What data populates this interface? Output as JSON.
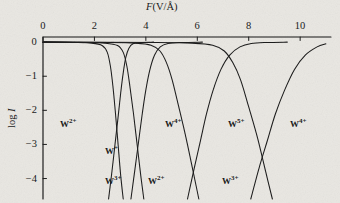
{
  "figure": {
    "background_color": "#e9e7e2",
    "ink_color": "#1a1a1a",
    "bleedthrough_text": "sample of the overlying page text showing through the thin paper of this scanned book figure and it continues for several lines across the block of justified body copy beneath the reproduced graph of field evaporation charge state distributions measured for tungsten emitter tips under varying applied electric field strength conditions",
    "axis_title": "F(V/Å)",
    "axis_title_italic_part": "F",
    "ylabel": "log I",
    "ylabel_italic_part": "I"
  },
  "chart_data": {
    "type": "line",
    "title": "",
    "xlabel": "F(V/Å)",
    "ylabel": "log I",
    "xlim": [
      0,
      11.2
    ],
    "ylim": [
      -4.6,
      0.15
    ],
    "xticks": [
      0,
      2,
      4,
      6,
      8,
      10
    ],
    "xtick_labels": [
      "0",
      "2",
      "4",
      "6",
      "8",
      "10"
    ],
    "yticks": [
      0,
      -1,
      -2,
      -3,
      -4
    ],
    "ytick_labels": [
      "0",
      "−1",
      "−2",
      "−3",
      "−4"
    ],
    "grid": false,
    "legend": "none",
    "axis_position": {
      "x_axis": "top",
      "y_axis": "left"
    },
    "series": [
      {
        "name": "W2+ rising branch",
        "label": "W2+",
        "points": [
          [
            0.0,
            0.0
          ],
          [
            1.2,
            -0.01
          ],
          [
            1.9,
            -0.03
          ],
          [
            2.3,
            -0.1
          ],
          [
            2.5,
            -0.3
          ],
          [
            2.62,
            -0.7
          ],
          [
            2.72,
            -1.3
          ],
          [
            2.82,
            -2.1
          ],
          [
            2.92,
            -3.0
          ],
          [
            3.02,
            -3.9
          ],
          [
            3.12,
            -4.6
          ]
        ]
      },
      {
        "name": "W1+ falling branch",
        "label": "W+",
        "points": [
          [
            2.55,
            -4.6
          ],
          [
            2.68,
            -3.8
          ],
          [
            2.8,
            -3.0
          ],
          [
            2.92,
            -2.2
          ],
          [
            3.02,
            -1.5
          ],
          [
            3.12,
            -0.9
          ],
          [
            3.22,
            -0.45
          ],
          [
            3.34,
            -0.18
          ],
          [
            3.5,
            -0.05
          ],
          [
            3.8,
            -0.01
          ],
          [
            4.3,
            0.0
          ]
        ]
      },
      {
        "name": "W3+ rising branch",
        "label": "W3+",
        "points": [
          [
            0.0,
            0.0
          ],
          [
            1.6,
            -0.01
          ],
          [
            2.4,
            -0.03
          ],
          [
            2.9,
            -0.1
          ],
          [
            3.12,
            -0.3
          ],
          [
            3.26,
            -0.7
          ],
          [
            3.38,
            -1.3
          ],
          [
            3.52,
            -2.1
          ],
          [
            3.66,
            -3.0
          ],
          [
            3.8,
            -3.9
          ],
          [
            3.92,
            -4.6
          ]
        ]
      },
      {
        "name": "W4+ left falling branch",
        "label": "W4+",
        "points": [
          [
            3.42,
            -4.6
          ],
          [
            3.58,
            -3.7
          ],
          [
            3.72,
            -2.9
          ],
          [
            3.86,
            -2.1
          ],
          [
            4.0,
            -1.4
          ],
          [
            4.16,
            -0.8
          ],
          [
            4.34,
            -0.38
          ],
          [
            4.56,
            -0.14
          ],
          [
            4.86,
            -0.04
          ],
          [
            5.4,
            -0.01
          ],
          [
            6.2,
            0.0
          ]
        ]
      },
      {
        "name": "W2+ second rising branch",
        "label": "W2+",
        "points": [
          [
            0.0,
            0.0
          ],
          [
            2.6,
            -0.01
          ],
          [
            3.6,
            -0.03
          ],
          [
            4.2,
            -0.09
          ],
          [
            4.55,
            -0.26
          ],
          [
            4.8,
            -0.6
          ],
          [
            5.02,
            -1.1
          ],
          [
            5.28,
            -1.9
          ],
          [
            5.56,
            -2.8
          ],
          [
            5.84,
            -3.8
          ],
          [
            6.06,
            -4.6
          ]
        ]
      },
      {
        "name": "W5+ falling branch",
        "label": "W5+",
        "points": [
          [
            5.62,
            -4.6
          ],
          [
            5.88,
            -3.7
          ],
          [
            6.12,
            -2.9
          ],
          [
            6.36,
            -2.1
          ],
          [
            6.62,
            -1.4
          ],
          [
            6.92,
            -0.8
          ],
          [
            7.26,
            -0.38
          ],
          [
            7.66,
            -0.14
          ],
          [
            8.1,
            -0.04
          ],
          [
            8.7,
            -0.01
          ],
          [
            9.5,
            0.0
          ]
        ]
      },
      {
        "name": "W3+ second rising branch",
        "label": "W3+",
        "points": [
          [
            0.0,
            0.0
          ],
          [
            4.4,
            -0.01
          ],
          [
            5.8,
            -0.03
          ],
          [
            6.6,
            -0.09
          ],
          [
            7.05,
            -0.26
          ],
          [
            7.38,
            -0.6
          ],
          [
            7.68,
            -1.1
          ],
          [
            8.0,
            -1.9
          ],
          [
            8.34,
            -2.8
          ],
          [
            8.66,
            -3.8
          ],
          [
            8.92,
            -4.6
          ]
        ]
      },
      {
        "name": "W4+ right falling branch",
        "label": "W4+",
        "points": [
          [
            8.08,
            -4.6
          ],
          [
            8.4,
            -3.7
          ],
          [
            8.72,
            -2.9
          ],
          [
            9.04,
            -2.1
          ],
          [
            9.4,
            -1.4
          ],
          [
            9.78,
            -0.8
          ],
          [
            10.2,
            -0.38
          ],
          [
            10.66,
            -0.14
          ],
          [
            11.0,
            -0.05
          ]
        ]
      }
    ],
    "annotations": [
      {
        "text": "W2+",
        "charge": "2+",
        "x_px": 60,
        "y_px": 118
      },
      {
        "text": "W+",
        "charge": "+",
        "x_px": 105,
        "y_px": 145
      },
      {
        "text": "W3+",
        "charge": "3+",
        "x_px": 105,
        "y_px": 175
      },
      {
        "text": "W2+",
        "charge": "2+",
        "x_px": 148,
        "y_px": 175
      },
      {
        "text": "W4+",
        "charge": "4+",
        "x_px": 165,
        "y_px": 118
      },
      {
        "text": "W5+",
        "charge": "5+",
        "x_px": 228,
        "y_px": 118
      },
      {
        "text": "W3+",
        "charge": "3+",
        "x_px": 222,
        "y_px": 175
      },
      {
        "text": "W4+",
        "charge": "4+",
        "x_px": 290,
        "y_px": 118
      }
    ]
  },
  "labels": {
    "xticks": [
      "0",
      "2",
      "4",
      "6",
      "8",
      "10"
    ],
    "yticks": [
      "0",
      "−1",
      "−2",
      "−3",
      "−4"
    ],
    "curves": [
      "W2+",
      "W+",
      "W3+",
      "W2+",
      "W4+",
      "W5+",
      "W3+",
      "W4+"
    ]
  }
}
